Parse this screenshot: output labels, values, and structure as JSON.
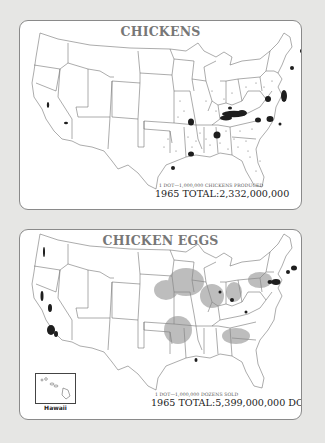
{
  "figure": {
    "background_color": "#e6e6e4",
    "panel_border_color": "#8a8a8a",
    "dot_color": "#222222"
  },
  "maps": [
    {
      "id": "chickens",
      "title": "CHICKENS",
      "dot_legend": "1 DOT—1,000,000 CHICKENS PRODUCED",
      "total": "1965 TOTAL:2,332,000,000",
      "region": "Contiguous United States",
      "dense_clusters": [
        "Northern Georgia / Alabama (heaviest)",
        "Delmarva Peninsula",
        "Northwest Arkansas",
        "Central Mississippi",
        "Northern Louisiana / Arkansas",
        "Shenandoah Valley, Virginia",
        "North Carolina piedmont",
        "Southern Maine",
        "Connecticut / Massachusetts",
        "East Texas",
        "Central California"
      ]
    },
    {
      "id": "eggs",
      "title": "CHICKEN EGGS",
      "dot_legend": "1 DOT—1,000,000 DOZENS SOLD",
      "total": "1965 TOTAL:5,399,000,000 DOZ.",
      "region": "United States including Hawaii inset",
      "inset_label": "Hawaii",
      "dense_clusters": [
        "Southern California (Los Angeles)",
        "Central California",
        "Southeastern Pennsylvania / New Jersey",
        "New England",
        "Iowa / Minnesota (diffuse)",
        "Indiana / Ohio",
        "Puget Sound, Washington",
        "Central Mississippi",
        "Georgia"
      ]
    }
  ]
}
